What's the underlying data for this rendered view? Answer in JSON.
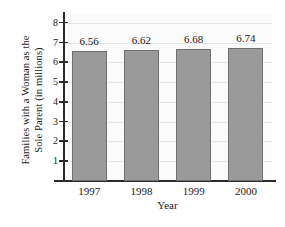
{
  "chart_data": {
    "type": "bar",
    "title": "",
    "categories": [
      "1997",
      "1998",
      "1999",
      "2000"
    ],
    "values": [
      6.56,
      6.62,
      6.68,
      6.74
    ],
    "value_labels": [
      "6.56",
      "6.62",
      "6.68",
      "6.74"
    ],
    "xlabel": "Year",
    "ylabel_lines": [
      "Families with a Woman as the",
      "Sole Parent (in millions)"
    ],
    "ylabel": "Families with a Woman as the Sole Parent (in millions)",
    "yticks": [
      "8",
      "7",
      "6",
      "5",
      "4",
      "3",
      "2",
      "1"
    ],
    "ytick_values": [
      8,
      7,
      6,
      5,
      4,
      3,
      2,
      1
    ],
    "ylim": [
      0,
      8.45
    ],
    "grid": true,
    "legend": null,
    "colors": {
      "bar_fill": "#9a9a9a",
      "bar_edge": "#6f6f6f",
      "axis": "#2b2b2b",
      "grid": "#e6e6e6",
      "plot_background": "#fbfbfb",
      "text": "#1a1a1a"
    }
  }
}
